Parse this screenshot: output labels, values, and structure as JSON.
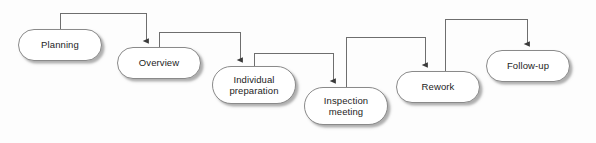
{
  "diagram": {
    "type": "flowchart",
    "background_color": "#fdfdfd",
    "node_fill_color": "#ffffff",
    "node_border_color": "#8a8a8a",
    "connector_color": "#6e6e6e",
    "text_color": "#1d1d1d",
    "nodes": [
      {
        "id": "planning",
        "label": "Planning",
        "x": 18,
        "y": 29,
        "w": 84,
        "h": 32
      },
      {
        "id": "overview",
        "label": "Overview",
        "x": 117,
        "y": 47,
        "w": 84,
        "h": 32
      },
      {
        "id": "individual",
        "label": "Individual\npreparation",
        "x": 212,
        "y": 66,
        "w": 84,
        "h": 38
      },
      {
        "id": "inspection",
        "label": "Inspection\nmeeting",
        "x": 304,
        "y": 87,
        "w": 84,
        "h": 38
      },
      {
        "id": "rework",
        "label": "Rework",
        "x": 396,
        "y": 71,
        "w": 84,
        "h": 32
      },
      {
        "id": "followup",
        "label": "Follow-up",
        "x": 486,
        "y": 50,
        "w": 84,
        "h": 32
      }
    ],
    "connectors": [
      {
        "id": "planning-to-overview",
        "from": "planning",
        "to": "overview",
        "path": "M 60 29 L 60 13 L 146 13 L 146 41"
      },
      {
        "id": "overview-to-individual",
        "from": "overview",
        "to": "individual",
        "path": "M 159 47 L 159 32 L 240 32 L 240 60"
      },
      {
        "id": "individual-to-inspection",
        "from": "individual",
        "to": "inspection",
        "path": "M 254 66 L 254 53 L 333 53 L 333 81"
      },
      {
        "id": "inspection-to-rework",
        "from": "inspection",
        "to": "rework",
        "path": "M 346 87 L 346 37 L 425 37 L 425 65"
      },
      {
        "id": "rework-to-followup",
        "from": "rework",
        "to": "followup",
        "path": "M 445 71 L 445 19 L 527 19 L 527 44"
      }
    ]
  }
}
